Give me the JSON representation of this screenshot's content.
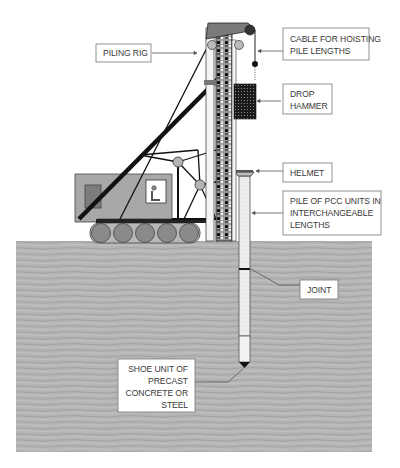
{
  "diagram": {
    "colors": {
      "ground": "#b3b3b3",
      "ground_dark": "#9a9a9a",
      "crane_body": "#a8a8a8",
      "crane_dark": "#7c7c7c",
      "leader_pattern": "#111111",
      "hammer": "#222222",
      "pile": "#ececec",
      "label_border": "#777777",
      "text": "#3a3a3a",
      "boom": "#111111"
    },
    "labels": {
      "cable": [
        "CABLE FOR HOISTING",
        "PILE LENGTHS"
      ],
      "piling_rig": [
        "PILING RIG"
      ],
      "drop_hammer": [
        "DROP",
        "HAMMER"
      ],
      "helmet": [
        "HELMET"
      ],
      "pile": [
        "PILE OF PCC UNITS IN",
        "INTERCHANGEABLE",
        "LENGTHS"
      ],
      "joint": [
        "JOINT"
      ],
      "shoe": [
        "SHOE UNIT OF",
        "PRECAST",
        "CONCRETE OR",
        "STEEL"
      ]
    }
  }
}
